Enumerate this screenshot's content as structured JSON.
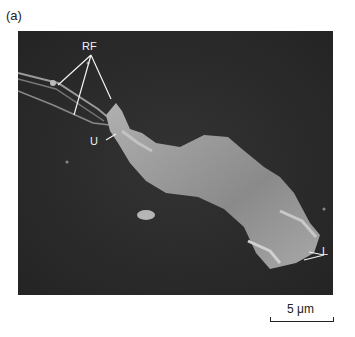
{
  "figure": {
    "panel_label": "(a)",
    "annotations": {
      "rf": "RF",
      "u": "U",
      "l": "L"
    },
    "scale_bar": {
      "label": "5 μm"
    },
    "colors": {
      "background": "#2b2b2b",
      "cell": "#9a9a9a",
      "label_line": "#f2f2f2"
    }
  }
}
